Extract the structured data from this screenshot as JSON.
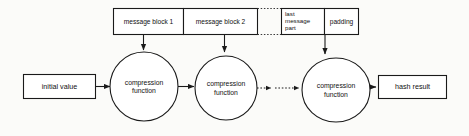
{
  "diagram": {
    "colors": {
      "background": "#fbfbf9",
      "stroke": "#1a1a1a",
      "text": "#111111",
      "shape_fill": "#ffffff"
    },
    "message_bar": {
      "name": "message-block-bar",
      "cells": [
        {
          "id": "message-block-1",
          "label": "message block 1",
          "multiline": false
        },
        {
          "id": "message-block-2",
          "label": "message block 2",
          "multiline": false
        },
        {
          "id": "continuation-gap",
          "label": "",
          "multiline": false
        },
        {
          "id": "last-message-part",
          "label_line1": "last",
          "label_line2": "message",
          "label_line3": "part",
          "multiline": true
        },
        {
          "id": "padding",
          "label": "padding",
          "multiline": false
        }
      ]
    },
    "nodes": {
      "initial_value": {
        "id": "initial-value-box",
        "label": "initial value"
      },
      "hash_result": {
        "id": "hash-result-box",
        "label": "hash result"
      },
      "compression_1": {
        "id": "compression-function-1",
        "label_line1": "compression",
        "label_line2": "function"
      },
      "compression_2": {
        "id": "compression-function-2",
        "label_line1": "compression",
        "label_line2": "function"
      },
      "compression_3": {
        "id": "compression-function-3",
        "label_line1": "compression",
        "label_line2": "function"
      }
    },
    "connectors": [
      {
        "id": "iv-to-compression-1",
        "style": "solid",
        "arrow": true
      },
      {
        "id": "compression-1-to-compression-2",
        "style": "solid",
        "arrow": true
      },
      {
        "id": "compression-2-to-compression-3",
        "style": "dotted",
        "arrow": true
      },
      {
        "id": "compression-3-to-hash-result",
        "style": "solid",
        "arrow": true
      },
      {
        "id": "block-1-to-compression-1",
        "style": "solid",
        "arrow": true
      },
      {
        "id": "block-2-to-compression-2",
        "style": "solid",
        "arrow": true
      },
      {
        "id": "padding-to-compression-3",
        "style": "solid",
        "arrow": true
      }
    ]
  }
}
